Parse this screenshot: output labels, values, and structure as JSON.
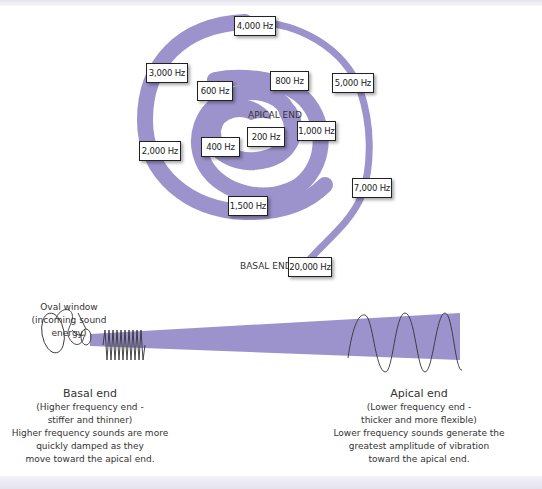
{
  "colors": {
    "spiral": "#9d93cc",
    "text": "#333333",
    "box_border": "#222222"
  },
  "spiral": {
    "apical_label": "APICAL END",
    "basal_label": "BASAL END",
    "frequencies": [
      {
        "label": "4,000 Hz",
        "x": 234,
        "y": 16,
        "w": 40
      },
      {
        "label": "3,000 Hz",
        "x": 146,
        "y": 63,
        "w": 40
      },
      {
        "label": "600 Hz",
        "x": 197,
        "y": 81,
        "w": 34
      },
      {
        "label": "800 Hz",
        "x": 270,
        "y": 71,
        "w": 37
      },
      {
        "label": "5,000 Hz",
        "x": 332,
        "y": 73,
        "w": 40
      },
      {
        "label": "200 Hz",
        "x": 247,
        "y": 127,
        "w": 36
      },
      {
        "label": "1,000 Hz",
        "x": 297,
        "y": 121,
        "w": 37
      },
      {
        "label": "400 Hz",
        "x": 201,
        "y": 137,
        "w": 37
      },
      {
        "label": "2,000 Hz",
        "x": 139,
        "y": 141,
        "w": 40
      },
      {
        "label": "7,000 Hz",
        "x": 352,
        "y": 178,
        "w": 38
      },
      {
        "label": "1,500 Hz",
        "x": 228,
        "y": 196,
        "w": 38
      },
      {
        "label": "20,000 Hz",
        "x": 288,
        "y": 257,
        "w": 42
      }
    ]
  },
  "oval_window": {
    "line1": "Oval window",
    "line2": "(incoming sound energy)"
  },
  "basal_caption": {
    "title": "Basal end",
    "lines": [
      "(Higher frequency end -",
      "stiffer and thinner)",
      "Higher frequency sounds are more",
      "quickly damped as they",
      "move toward the apical end."
    ]
  },
  "apical_caption": {
    "title": "Apical end",
    "lines": [
      "(Lower frequency end -",
      "thicker and more flexible)",
      "Lower frequency sounds generate the",
      "greatest amplitude of vibration",
      "toward the apical end."
    ]
  }
}
